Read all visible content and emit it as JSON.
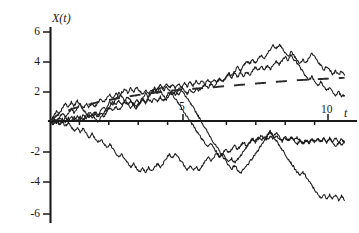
{
  "chart_data": {
    "type": "line",
    "title": "",
    "subtitle": "",
    "xlabel": "t",
    "ylabel": "X(t)",
    "xlim": [
      0,
      10.5
    ],
    "ylim": [
      -6.5,
      6.5
    ],
    "grid": false,
    "legend": "none",
    "annotations": [
      "Five simulated Brownian-motion / random-walk sample paths started at X(0)=0",
      "Dashed curve shows the rising mean / square-root envelope trend"
    ],
    "x_ticks": [
      {
        "value": 5,
        "label": "5"
      },
      {
        "value": 10,
        "label": "10"
      }
    ],
    "x_minor_ticks": [
      1,
      2,
      3,
      4,
      6,
      7,
      8,
      9
    ],
    "y_ticks": [
      {
        "value": 6,
        "label": "6"
      },
      {
        "value": 4,
        "label": "4"
      },
      {
        "value": 2,
        "label": "2"
      },
      {
        "value": -2,
        "label": "-2"
      },
      {
        "value": -4,
        "label": "-4"
      },
      {
        "value": -6,
        "label": "-6"
      }
    ],
    "series": [
      {
        "name": "path-1",
        "color": "#1c1c1c",
        "values": [
          0,
          0.35,
          0.62,
          0.45,
          0.85,
          1.15,
          0.9,
          1.25,
          1.0,
          1.35,
          1.1,
          0.75,
          0.5,
          0.2,
          0.45,
          0.2,
          -0.1,
          0.25,
          0.55,
          0.9,
          1.3,
          1.05,
          1.45,
          1.85,
          1.6,
          1.35,
          1.6,
          1.35,
          1.05,
          0.8,
          1.15,
          1.5,
          1.2,
          1.55,
          1.85,
          2.1,
          1.8,
          2.0,
          1.7,
          1.4,
          1.7,
          2.0,
          1.75,
          2.05,
          2.3,
          2.05,
          1.8,
          2.1,
          1.85,
          2.15,
          2.0,
          2.25,
          2.45,
          2.2,
          2.5,
          2.25,
          2.55,
          2.8,
          2.6,
          2.9,
          3.2,
          3.0,
          3.3,
          3.6,
          3.35,
          3.7,
          4.0,
          3.8,
          4.1,
          3.85,
          4.15,
          4.4,
          4.15,
          4.45,
          4.75,
          5.05,
          4.8,
          5.1,
          4.85,
          4.55,
          4.3,
          4.6,
          4.35,
          4.05,
          3.8,
          4.1,
          3.85,
          4.25,
          4.5,
          4.25,
          3.95,
          3.7,
          3.4,
          3.65,
          3.4,
          3.1,
          3.35,
          3.1,
          3.3,
          3.05
        ]
      },
      {
        "name": "path-2",
        "color": "#1c1c1c",
        "values": [
          0,
          0.2,
          -0.05,
          0.25,
          0.5,
          0.25,
          0.55,
          0.8,
          0.55,
          0.85,
          1.1,
          0.85,
          1.15,
          0.9,
          1.2,
          0.95,
          1.25,
          1.5,
          1.25,
          1.55,
          1.8,
          1.55,
          1.85,
          1.6,
          1.9,
          2.15,
          1.9,
          2.2,
          1.95,
          2.25,
          2.0,
          1.75,
          2.05,
          1.8,
          2.1,
          1.85,
          2.15,
          2.4,
          2.15,
          2.45,
          2.2,
          2.45,
          2.2,
          2.5,
          2.25,
          2.55,
          2.3,
          2.6,
          2.35,
          2.65,
          2.4,
          2.7,
          2.45,
          2.75,
          2.5,
          2.8,
          2.55,
          2.85,
          2.6,
          2.9,
          3.15,
          2.9,
          3.2,
          2.95,
          3.25,
          3.0,
          3.3,
          3.05,
          3.35,
          3.6,
          3.35,
          3.65,
          3.4,
          3.7,
          3.45,
          3.75,
          4.0,
          3.75,
          4.05,
          4.3,
          4.05,
          4.35,
          4.1,
          3.85,
          3.6,
          3.3,
          3.0,
          2.7,
          2.95,
          2.65,
          2.35,
          2.6,
          2.3,
          2.0,
          2.25,
          1.95,
          1.7,
          1.95,
          1.65,
          1.7
        ]
      },
      {
        "name": "path-3",
        "color": "#1c1c1c",
        "values": [
          0,
          -0.15,
          0.1,
          -0.15,
          0.15,
          -0.1,
          0.2,
          -0.05,
          0.25,
          0.0,
          0.3,
          0.05,
          0.35,
          0.6,
          0.35,
          0.65,
          0.4,
          0.7,
          0.95,
          0.7,
          1.0,
          1.3,
          1.05,
          1.35,
          1.1,
          1.4,
          1.15,
          0.9,
          1.2,
          0.95,
          1.25,
          1.55,
          1.85,
          1.6,
          1.9,
          2.2,
          1.95,
          2.25,
          2.0,
          2.3,
          2.05,
          1.8,
          1.5,
          1.2,
          0.9,
          0.6,
          0.3,
          0.0,
          -0.3,
          -0.6,
          -0.9,
          -1.2,
          -1.45,
          -1.75,
          -1.5,
          -1.8,
          -2.1,
          -2.4,
          -2.15,
          -2.45,
          -2.75,
          -2.5,
          -2.8,
          -2.55,
          -2.3,
          -2.0,
          -1.75,
          -1.45,
          -1.2,
          -1.45,
          -1.2,
          -0.95,
          -1.25,
          -0.95,
          -0.7,
          -1.0,
          -0.75,
          -1.05,
          -1.3,
          -1.05,
          -1.3,
          -1.05,
          -1.3,
          -1.55,
          -1.3,
          -1.55,
          -1.3,
          -1.5,
          -1.25,
          -1.45,
          -1.2,
          -1.4,
          -1.15,
          -1.35,
          -1.15,
          -1.35,
          -1.15,
          -1.4,
          -1.6,
          -1.35
        ]
      },
      {
        "name": "path-4",
        "color": "#1c1c1c",
        "values": [
          0,
          -0.25,
          0.0,
          -0.3,
          -0.05,
          -0.35,
          -0.1,
          -0.4,
          -0.7,
          -0.45,
          -0.75,
          -0.5,
          -0.8,
          -1.1,
          -0.85,
          -1.15,
          -1.45,
          -1.2,
          -1.5,
          -1.8,
          -1.55,
          -1.85,
          -2.15,
          -2.45,
          -2.2,
          -2.5,
          -2.8,
          -3.1,
          -2.85,
          -3.15,
          -3.4,
          -3.15,
          -3.4,
          -3.1,
          -3.35,
          -3.1,
          -2.85,
          -3.05,
          -2.8,
          -2.5,
          -2.2,
          -2.45,
          -2.2,
          -2.45,
          -2.7,
          -2.95,
          -3.25,
          -3.0,
          -3.3,
          -3.05,
          -3.3,
          -3.0,
          -2.7,
          -2.4,
          -2.65,
          -2.4,
          -2.15,
          -2.4,
          -2.15,
          -1.9,
          -2.15,
          -1.9,
          -1.65,
          -1.9,
          -1.65,
          -1.4,
          -1.65,
          -1.4,
          -1.15,
          -1.35,
          -1.1,
          -1.3,
          -1.05,
          -1.25,
          -1.0,
          -1.2,
          -0.95,
          -1.15,
          -1.35,
          -1.1,
          -1.3,
          -1.1,
          -1.3,
          -1.1,
          -1.3,
          -1.5,
          -1.25,
          -1.45,
          -1.2,
          -1.4,
          -1.2,
          -1.4,
          -1.2,
          -1.45,
          -1.2,
          -1.45,
          -1.7,
          -1.45,
          -1.2,
          -1.45
        ]
      },
      {
        "name": "path-5",
        "color": "#1c1c1c",
        "values": [
          0,
          0.15,
          -0.1,
          0.2,
          -0.05,
          0.25,
          0.0,
          0.3,
          0.05,
          0.35,
          0.1,
          0.4,
          0.15,
          0.45,
          0.2,
          0.5,
          0.25,
          0.55,
          0.3,
          0.6,
          0.9,
          0.65,
          0.95,
          0.7,
          1.0,
          1.3,
          1.05,
          1.35,
          1.1,
          1.4,
          1.15,
          1.45,
          1.2,
          1.5,
          1.25,
          1.55,
          1.3,
          1.6,
          1.35,
          1.65,
          1.95,
          1.7,
          2.0,
          1.75,
          2.05,
          1.8,
          1.5,
          1.2,
          0.9,
          0.6,
          0.25,
          -0.1,
          -0.45,
          -0.8,
          -1.1,
          -1.45,
          -1.75,
          -2.05,
          -2.35,
          -2.65,
          -2.95,
          -3.2,
          -2.95,
          -3.25,
          -3.5,
          -3.25,
          -3.0,
          -2.75,
          -2.5,
          -2.2,
          -1.9,
          -1.6,
          -1.3,
          -1.0,
          -0.75,
          -1.0,
          -1.3,
          -1.6,
          -1.9,
          -2.2,
          -2.5,
          -2.8,
          -3.1,
          -3.4,
          -3.65,
          -3.4,
          -3.7,
          -4.0,
          -4.3,
          -4.6,
          -4.9,
          -5.15,
          -4.9,
          -5.15,
          -4.9,
          -5.2,
          -4.95,
          -5.25,
          -5.0,
          -5.3
        ]
      }
    ],
    "trend": {
      "name": "mean-trend-dashed",
      "style": "dashed",
      "color": "#2a2a2a",
      "values": [
        0,
        0.35,
        0.55,
        0.7,
        0.85,
        0.95,
        1.05,
        1.15,
        1.25,
        1.32,
        1.4,
        1.48,
        1.55,
        1.62,
        1.68,
        1.74,
        1.8,
        1.85,
        1.9,
        1.95,
        2.0,
        2.04,
        2.08,
        2.11,
        2.14,
        2.17,
        2.2,
        2.23,
        2.26,
        2.3,
        2.33,
        2.36,
        2.4,
        2.43,
        2.47,
        2.5,
        2.53,
        2.56,
        2.6,
        2.63,
        2.66,
        2.69,
        2.72,
        2.74,
        2.76,
        2.78,
        2.8,
        2.82,
        2.84,
        2.86,
        2.88
      ]
    }
  },
  "labels": {
    "y_axis_title": "X(t)",
    "x_axis_title": "t",
    "tick_6": "6",
    "tick_4": "4",
    "tick_2": "2",
    "tick_m2": "-2",
    "tick_m4": "-4",
    "tick_m6": "-6",
    "tick_5": "5",
    "tick_10": "10"
  }
}
